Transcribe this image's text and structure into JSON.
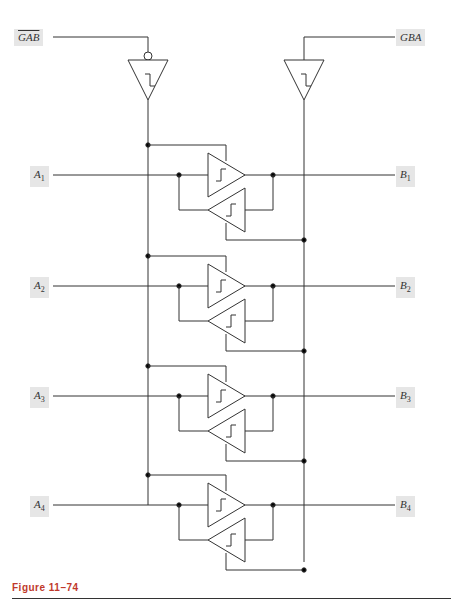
{
  "signals": {
    "gab": "GAB",
    "gba": "GBA",
    "a": [
      "A",
      "A",
      "A",
      "A"
    ],
    "a_sub": [
      "1",
      "2",
      "3",
      "4"
    ],
    "b": [
      "B",
      "B",
      "B",
      "B"
    ],
    "b_sub": [
      "1",
      "2",
      "3",
      "4"
    ]
  },
  "caption": {
    "prefix": "Figure",
    "number": "11–74"
  },
  "colors": {
    "line": "#333333",
    "label_bg": "#e6e6e6",
    "caption": "#c0392b"
  }
}
